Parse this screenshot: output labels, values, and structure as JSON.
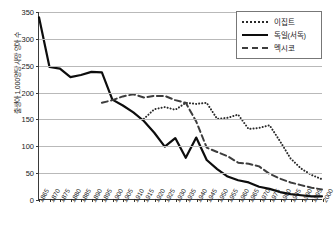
{
  "chart_data": {
    "type": "line",
    "title": "",
    "xlabel": "",
    "ylabel": "출생아 1,000명당 사망 영아 수",
    "ylim": [
      0,
      350
    ],
    "yticks": [
      0,
      50,
      100,
      150,
      200,
      250,
      300,
      350
    ],
    "grid": true,
    "legend_position": "top-right",
    "x": [
      1865,
      1870,
      1875,
      1880,
      1885,
      1890,
      1895,
      1900,
      1905,
      1910,
      1915,
      1920,
      1925,
      1930,
      1935,
      1940,
      1945,
      1950,
      1955,
      1960,
      1965,
      1970,
      1975,
      1980,
      1985,
      1990,
      1995,
      2000
    ],
    "xticklabels": [
      "1865",
      "1870",
      "1875",
      "1880",
      "1885",
      "1890",
      "1895",
      "1900",
      "1905",
      "1910",
      "1915",
      "1920",
      "1925",
      "1930",
      "1935",
      "1940",
      "1945",
      "1950",
      "1955",
      "1960",
      "1965",
      "1970",
      "1975",
      "1980",
      "1985",
      "1990",
      "1995",
      "2000"
    ],
    "series": [
      {
        "name": "이집트",
        "style": "dotted",
        "color": "#2a2a2a",
        "x": [
          1915,
          1920,
          1925,
          1930,
          1935,
          1940,
          1945,
          1950,
          1955,
          1960,
          1965,
          1970,
          1975,
          1980,
          1985,
          1990,
          1995,
          2000
        ],
        "values": [
          150,
          168,
          172,
          167,
          180,
          178,
          180,
          150,
          152,
          158,
          131,
          133,
          138,
          108,
          76,
          57,
          45,
          37
        ]
      },
      {
        "name": "독일(서독)",
        "style": "solid",
        "color": "#0d0d0d",
        "x": [
          1865,
          1870,
          1875,
          1880,
          1885,
          1890,
          1895,
          1900,
          1905,
          1910,
          1915,
          1920,
          1925,
          1930,
          1935,
          1940,
          1945,
          1950,
          1955,
          1960,
          1965,
          1970,
          1975,
          1980,
          1985,
          1990,
          1995,
          2000
        ],
        "values": [
          340,
          247,
          244,
          228,
          232,
          238,
          237,
          186,
          175,
          162,
          146,
          124,
          98,
          114,
          77,
          115,
          73,
          56,
          42,
          35,
          31,
          23,
          19,
          13,
          9,
          7,
          5,
          5
        ]
      },
      {
        "name": "멕시코",
        "style": "dashed",
        "color": "#3d3d3d",
        "x": [
          1895,
          1900,
          1905,
          1910,
          1915,
          1920,
          1925,
          1930,
          1935,
          1940,
          1945,
          1950,
          1955,
          1960,
          1965,
          1970,
          1975,
          1980,
          1985,
          1990,
          1995,
          2000
        ],
        "values": [
          180,
          185,
          192,
          196,
          190,
          193,
          193,
          185,
          180,
          145,
          96,
          88,
          80,
          68,
          66,
          61,
          47,
          38,
          31,
          26,
          21,
          18
        ]
      }
    ]
  },
  "legend": {
    "items": [
      {
        "label": "이집트",
        "key": "dotted-line-key"
      },
      {
        "label": "독일(서독)",
        "key": "solid-line-key"
      },
      {
        "label": "멕시코",
        "key": "dashed-line-key"
      }
    ]
  }
}
